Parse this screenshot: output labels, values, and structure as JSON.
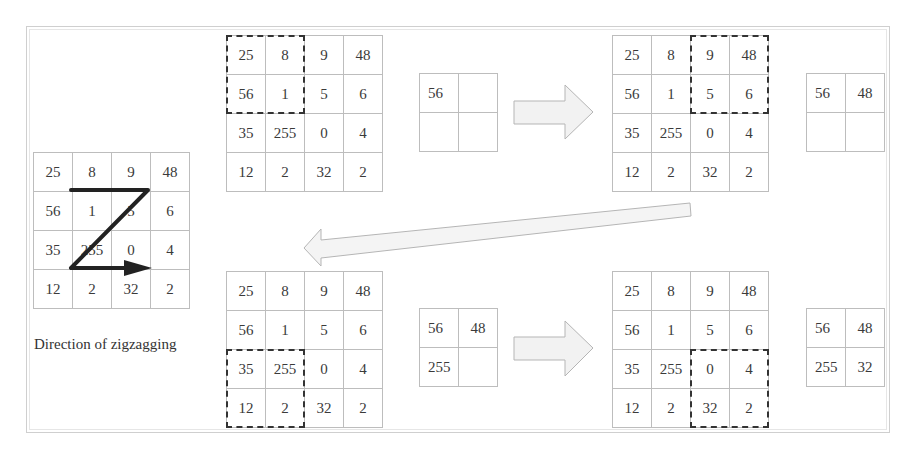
{
  "matrix": [
    [
      "25",
      "8",
      "9",
      "48"
    ],
    [
      "56",
      "1",
      "5",
      "6"
    ],
    [
      "35",
      "255",
      "0",
      "4"
    ],
    [
      "12",
      "2",
      "32",
      "2"
    ]
  ],
  "steps": [
    {
      "window": "top-left",
      "pooled": [
        "56",
        "",
        "",
        ""
      ]
    },
    {
      "window": "top-right",
      "pooled": [
        "56",
        "48",
        "",
        ""
      ]
    },
    {
      "window": "bottom-left",
      "pooled": [
        "56",
        "48",
        "255",
        ""
      ]
    },
    {
      "window": "bottom-right",
      "pooled": [
        "56",
        "48",
        "255",
        "32"
      ]
    }
  ],
  "caption": "Direction of zigzagging",
  "colors": {
    "grid_line": "#bdbdbd",
    "dashed_window": "#333333",
    "arrow_fill": "#f2f2f2",
    "arrow_stroke": "#b5b5b5",
    "zigzag": "#222222"
  }
}
